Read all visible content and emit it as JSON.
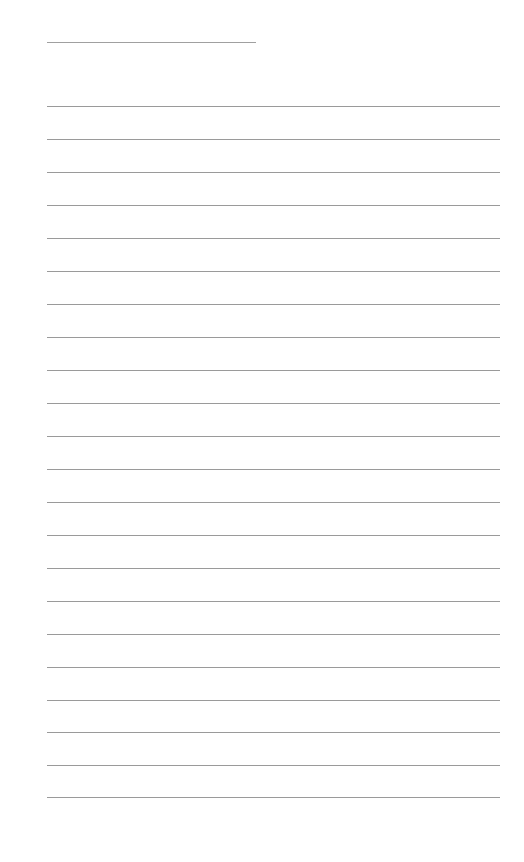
{
  "page": {
    "type": "lined-notepaper",
    "background_color": "#ffffff",
    "line_color": "#9a9a9a",
    "width": 524,
    "height": 862
  },
  "header_line": {
    "x_start": 47,
    "x_end": 256,
    "y": 42
  },
  "ruled_lines": {
    "x_start": 47,
    "x_end": 500,
    "count": 22,
    "y_positions": [
      106,
      139,
      172,
      205,
      238,
      271,
      304,
      337,
      370,
      403,
      436,
      469,
      502,
      535,
      568,
      601,
      634,
      667,
      700,
      732,
      765,
      797
    ]
  }
}
